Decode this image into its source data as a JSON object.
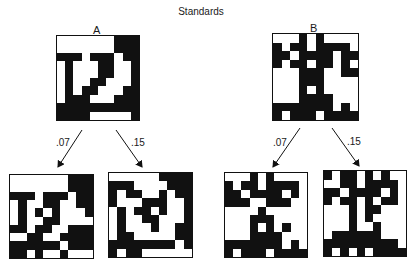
{
  "title": "Standards",
  "standards": [
    {
      "label": "A",
      "grid": [
        "WWWWWWWBBB",
        "WWWWWWWBBB",
        "BBBWBBBWBB",
        "WBWWWBBWWB",
        "WBWWWBBWWB",
        "WBWWBBWWWB",
        "WBWBBWWWBB",
        "WBBBWWWBBB",
        "BBBBBBBBBB",
        "BBBBWWWWWB"
      ],
      "variants": [
        {
          "probability": ".07",
          "grid": [
            "WWWWWWWBBB",
            "WWWWWWWBBB",
            "BBBWBBBWBB",
            "WBWWBBWWBB",
            "WBWBWBWWWB",
            "WBWWBBWWWW",
            "BBWBBWWBBB",
            "WWBBWWBBBB",
            "BBBBBBWBBB",
            "BBWBWWBWWW"
          ]
        },
        {
          "probability": ".15",
          "grid": [
            "WWWWWWBBBB",
            "BBBWWWWBBB",
            "BWBBWWBWBB",
            "BWWWBBBWWB",
            "WBWBBWBWWB",
            "WBWWBBWWWB",
            "WBWWWBWWBB",
            "WBBWWWWWBB",
            "BBBBBBBBWB",
            "BWBBWWWWWW"
          ]
        }
      ]
    },
    {
      "label": "B",
      "grid": [
        "WWWBWBWWWW",
        "BWBBWBBBBW",
        "BBWBBBBWBB",
        "BWBBWBBWBW",
        "WWWBBBWWBB",
        "WWWBBBWWWW",
        "WWWBWBWWWW",
        "WWWBBBBWWW",
        "BBBBBBBWBW",
        "BWBBBWBBBB"
      ],
      "variants": [
        {
          "probability": ".07",
          "grid": [
            "WWWBWBWWWW",
            "BWBBWBBBBW",
            "BBWBBBBWBW",
            "BBBWWBBBWW",
            "WWWWBWWWWW",
            "WWWBBBWWWW",
            "WWWBWBWBWW",
            "WWWBBBBWWW",
            "BBBBBBBWBW",
            "BWBBBWBBBB"
          ]
        },
        {
          "probability": ".15",
          "grid": [
            "BWBBWBWBWW",
            "WWBBWBBBBW",
            "BBWBBBBWBW",
            "BWBBWBWBBW",
            "WWWBWBBWWW",
            "WWWBWBWWWW",
            "WWWBWWBWWW",
            "WBBBBBBWWW",
            "BBBBBBBBBW",
            "BWBWBWBBBB"
          ]
        }
      ]
    }
  ]
}
